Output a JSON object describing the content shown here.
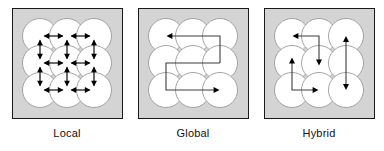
{
  "figure": {
    "background_color": "#ffffff",
    "panel_fill_color": "#d4d4d4",
    "panel_border_color": "#1a1a1a",
    "node_fill_color": "#ffffff",
    "node_stroke_color": "#9a9a9a",
    "arrow_color": "#000000",
    "path_color": "#3c3c3c"
  },
  "panels": [
    {
      "id": "local",
      "label": "Local",
      "grid": {
        "rows": 3,
        "cols": 3
      },
      "connection_style": "bidirectional-nearest-neighbor",
      "arrow_count": 12,
      "description": "Each node exchanges with its immediate horizontal and vertical neighbours via double-headed arrows."
    },
    {
      "id": "global",
      "label": "Global",
      "grid": {
        "rows": 3,
        "cols": 3
      },
      "connection_style": "serpentine-single-path",
      "arrow_count": 2,
      "description": "A single snake-like route threads every node; arrowheads mark the direction of travel."
    },
    {
      "id": "hybrid",
      "label": "Hybrid",
      "grid": {
        "rows": 3,
        "cols": 3
      },
      "connection_style": "mixed-local-and-global",
      "arrow_count": 5,
      "description": "Short L-shaped routes plus one long vertical link combine local and global exchange."
    }
  ]
}
